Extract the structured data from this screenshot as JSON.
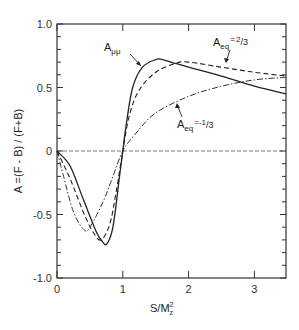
{
  "chart_data": {
    "type": "line",
    "title": "",
    "xlabel": "S/M_z^2",
    "xlabel_main": "S/M",
    "xlabel_sup": "2",
    "xlabel_sub": "z",
    "ylabel": "A =(F - B) / (F+B)",
    "xlim": [
      0,
      3.48
    ],
    "ylim": [
      -1.0,
      1.0
    ],
    "x_ticks": [
      0,
      1,
      2,
      3
    ],
    "x_tick_labels": [
      "0",
      "1",
      "2",
      "3"
    ],
    "y_ticks": [
      1.0,
      0.5,
      0,
      -0.5,
      -1.0
    ],
    "y_tick_labels": [
      "1.0",
      "0.5",
      "0",
      "-0.5",
      "-1.0"
    ],
    "y_minor_step": 0.1,
    "grid": false,
    "reference_line": {
      "y": 0,
      "style": "dashed"
    },
    "series": [
      {
        "name": "A_μμ",
        "label_main": "A",
        "label_sub": "μμ",
        "style": "solid",
        "x": [
          0,
          0.2,
          0.4,
          0.6,
          0.7,
          0.76,
          0.85,
          0.95,
          1.0,
          1.05,
          1.15,
          1.3,
          1.5,
          1.6,
          1.8,
          2.0,
          2.5,
          3.0,
          3.48
        ],
        "values": [
          0,
          -0.12,
          -0.38,
          -0.64,
          -0.72,
          -0.73,
          -0.6,
          -0.2,
          0,
          0.2,
          0.5,
          0.66,
          0.72,
          0.72,
          0.69,
          0.66,
          0.59,
          0.51,
          0.45
        ]
      },
      {
        "name": "A_eq = 2/3",
        "label_main": "A",
        "label_sub": "eq",
        "label_value": "= 2/3",
        "style": "dashed",
        "x": [
          0,
          0.2,
          0.4,
          0.55,
          0.67,
          0.8,
          0.9,
          1.0,
          1.1,
          1.25,
          1.5,
          1.8,
          2.0,
          2.5,
          3.0,
          3.48
        ],
        "values": [
          0,
          -0.22,
          -0.48,
          -0.64,
          -0.7,
          -0.58,
          -0.32,
          0,
          0.28,
          0.48,
          0.62,
          0.69,
          0.7,
          0.66,
          0.62,
          0.59
        ]
      },
      {
        "name": "A_eq = -1/3",
        "label_main": "A",
        "label_sub": "eq",
        "label_value": "= -1/3",
        "style": "dash-dot",
        "x": [
          0,
          0.1,
          0.25,
          0.41,
          0.5,
          0.7,
          0.85,
          1.0,
          1.2,
          1.5,
          2.0,
          2.5,
          3.0,
          3.48
        ],
        "values": [
          0,
          -0.2,
          -0.48,
          -0.62,
          -0.6,
          -0.4,
          -0.2,
          0,
          0.14,
          0.3,
          0.43,
          0.51,
          0.56,
          0.58
        ]
      }
    ]
  }
}
